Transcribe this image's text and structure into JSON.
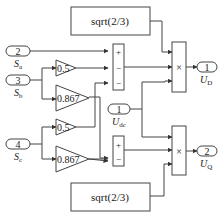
{
  "diagram": {
    "inports": [
      {
        "id": "Sa",
        "number": "2",
        "label": "S",
        "sub": "a"
      },
      {
        "id": "Sb",
        "number": "3",
        "label": "S",
        "sub": "b"
      },
      {
        "id": "Sc",
        "number": "4",
        "label": "S",
        "sub": "c"
      },
      {
        "id": "Udc",
        "number": "1",
        "label": "U",
        "sub": "dc"
      }
    ],
    "outports": [
      {
        "id": "UD",
        "number": "1",
        "label": "U",
        "sub": "D"
      },
      {
        "id": "UQ",
        "number": "2",
        "label": "U",
        "sub": "Q"
      }
    ],
    "gains": [
      {
        "id": "gain_b_05",
        "value": "0.5"
      },
      {
        "id": "gain_b_0867",
        "value": "0.867"
      },
      {
        "id": "gain_c_05",
        "value": "0.5"
      },
      {
        "id": "gain_c_0867",
        "value": "0.867"
      }
    ],
    "constants": [
      {
        "id": "const_top",
        "value": "sqrt(2/3)"
      },
      {
        "id": "const_bottom",
        "value": "sqrt(2/3)"
      }
    ],
    "sums": [
      {
        "id": "sum_d",
        "signs": [
          "+",
          "−",
          "−"
        ]
      },
      {
        "id": "sum_q",
        "signs": [
          "+",
          "−"
        ]
      }
    ],
    "products": [
      {
        "id": "prod_d",
        "symbol": "×"
      },
      {
        "id": "prod_q",
        "symbol": "×"
      }
    ]
  }
}
